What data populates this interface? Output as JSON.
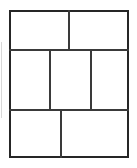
{
  "figure": {
    "kind": "rectangle-partition-diagram",
    "line_color": "#262626",
    "inner_line_color": "#3a3a3a",
    "fill_color": "#ffffff",
    "background_color": "#ffffff",
    "artifact_color": "#d8d8d8",
    "outer": {
      "left": 0,
      "top": 0,
      "width": 120,
      "height": 148,
      "stroke_width": 2
    },
    "rows": [
      {
        "name": "top-row",
        "top": 0,
        "height": 39,
        "cell_count": 2
      },
      {
        "name": "middle-row",
        "top": 39,
        "height": 60,
        "cell_count": 3
      },
      {
        "name": "bottom-row",
        "top": 99,
        "height": 49,
        "cell_count": 2
      }
    ],
    "horizontal_dividers": [
      {
        "name": "divider-top-middle",
        "y": 39,
        "x1": 0,
        "x2": 120
      },
      {
        "name": "divider-middle-bottom",
        "y": 99,
        "x1": 0,
        "x2": 120
      }
    ],
    "vertical_dividers": [
      {
        "name": "divider-top-row",
        "x": 60,
        "y1": 0,
        "y2": 39
      },
      {
        "name": "divider-middle-left",
        "x": 41,
        "y1": 39,
        "y2": 99
      },
      {
        "name": "divider-middle-right",
        "x": 82,
        "y1": 39,
        "y2": 99
      },
      {
        "name": "divider-bottom-row",
        "x": 52,
        "y1": 99,
        "y2": 148
      }
    ],
    "cells": [
      {
        "name": "cell-top-left",
        "label": "1",
        "left": 0,
        "top": 0,
        "width": 60,
        "height": 39
      },
      {
        "name": "cell-top-right",
        "label": "2",
        "left": 60,
        "top": 0,
        "width": 60,
        "height": 39
      },
      {
        "name": "cell-middle-left",
        "label": "3",
        "left": 0,
        "top": 39,
        "width": 41,
        "height": 60
      },
      {
        "name": "cell-middle-center",
        "label": "4",
        "left": 41,
        "top": 39,
        "width": 41,
        "height": 60
      },
      {
        "name": "cell-middle-right",
        "label": "5",
        "left": 82,
        "top": 39,
        "width": 38,
        "height": 60
      },
      {
        "name": "cell-bottom-left",
        "label": "6",
        "left": 0,
        "top": 99,
        "width": 52,
        "height": 49
      },
      {
        "name": "cell-bottom-right",
        "label": "7",
        "left": 52,
        "top": 99,
        "width": 68,
        "height": 49
      }
    ]
  }
}
